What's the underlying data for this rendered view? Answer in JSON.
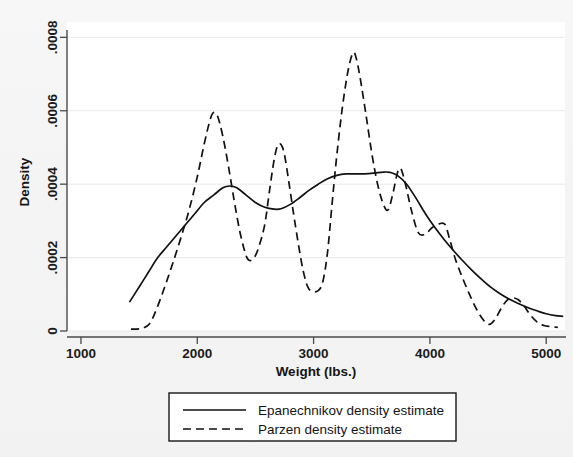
{
  "chart_data": {
    "type": "line",
    "title": "",
    "xlabel": "Weight (lbs.)",
    "ylabel": "Density",
    "xlim": [
      880,
      5170
    ],
    "ylim": [
      0,
      0.00082
    ],
    "xticks": [
      1000,
      2000,
      3000,
      4000,
      5000
    ],
    "xtick_labels": [
      "1000",
      "2000",
      "3000",
      "4000",
      "5000"
    ],
    "yticks": [
      0,
      0.0002,
      0.0004,
      0.0006,
      0.0008
    ],
    "ytick_labels": [
      "0",
      ".0002",
      ".0004",
      ".0006",
      ".0008"
    ],
    "grid": true,
    "legend_position": "below-axes",
    "series": [
      {
        "name": "Epanechnikov density estimate",
        "style": "solid",
        "color": "#111111",
        "points": [
          [
            1420,
            8e-05
          ],
          [
            1500,
            0.00012
          ],
          [
            1580,
            0.00016
          ],
          [
            1660,
            0.0002
          ],
          [
            1740,
            0.00023
          ],
          [
            1820,
            0.00026
          ],
          [
            1900,
            0.00029
          ],
          [
            1980,
            0.00032
          ],
          [
            2060,
            0.00035
          ],
          [
            2140,
            0.00037
          ],
          [
            2220,
            0.00039
          ],
          [
            2280,
            0.000395
          ],
          [
            2340,
            0.00039
          ],
          [
            2420,
            0.00037
          ],
          [
            2500,
            0.00035
          ],
          [
            2580,
            0.000337
          ],
          [
            2660,
            0.000332
          ],
          [
            2720,
            0.000333
          ],
          [
            2800,
            0.000345
          ],
          [
            2880,
            0.000363
          ],
          [
            2960,
            0.000383
          ],
          [
            3040,
            0.0004
          ],
          [
            3120,
            0.000415
          ],
          [
            3200,
            0.000424
          ],
          [
            3280,
            0.000428
          ],
          [
            3360,
            0.000428
          ],
          [
            3440,
            0.000428
          ],
          [
            3520,
            0.00043
          ],
          [
            3600,
            0.000433
          ],
          [
            3660,
            0.000432
          ],
          [
            3720,
            0.000424
          ],
          [
            3800,
            0.0004
          ],
          [
            3880,
            0.000362
          ],
          [
            3960,
            0.00032
          ],
          [
            4040,
            0.000283
          ],
          [
            4120,
            0.00025
          ],
          [
            4200,
            0.00022
          ],
          [
            4280,
            0.000192
          ],
          [
            4360,
            0.000166
          ],
          [
            4440,
            0.000142
          ],
          [
            4520,
            0.00012
          ],
          [
            4600,
            0.000102
          ],
          [
            4680,
            8.7e-05
          ],
          [
            4760,
            7.5e-05
          ],
          [
            4840,
            6.4e-05
          ],
          [
            4920,
            5.5e-05
          ],
          [
            5000,
            4.7e-05
          ],
          [
            5080,
            4.2e-05
          ],
          [
            5140,
            4e-05
          ]
        ]
      },
      {
        "name": "Parzen density estimate",
        "style": "dashed",
        "color": "#111111",
        "points": [
          [
            1430,
            5e-06
          ],
          [
            1520,
            7e-06
          ],
          [
            1590,
            2e-05
          ],
          [
            1650,
            6e-05
          ],
          [
            1720,
            0.00012
          ],
          [
            1790,
            0.000185
          ],
          [
            1860,
            0.000255
          ],
          [
            1930,
            0.00033
          ],
          [
            2000,
            0.00042
          ],
          [
            2060,
            0.00051
          ],
          [
            2110,
            0.000575
          ],
          [
            2140,
            0.000595
          ],
          [
            2175,
            0.000585
          ],
          [
            2220,
            0.00053
          ],
          [
            2270,
            0.000445
          ],
          [
            2320,
            0.00035
          ],
          [
            2370,
            0.000265
          ],
          [
            2420,
            0.000205
          ],
          [
            2450,
            0.000192
          ],
          [
            2490,
            0.0002
          ],
          [
            2530,
            0.00023
          ],
          [
            2580,
            0.00029
          ],
          [
            2620,
            0.00038
          ],
          [
            2660,
            0.000465
          ],
          [
            2690,
            0.000505
          ],
          [
            2720,
            0.000508
          ],
          [
            2750,
            0.00048
          ],
          [
            2790,
            0.0004
          ],
          [
            2830,
            0.000315
          ],
          [
            2870,
            0.000235
          ],
          [
            2910,
            0.000165
          ],
          [
            2950,
            0.00012
          ],
          [
            2990,
            0.000108
          ],
          [
            3040,
            0.00011
          ],
          [
            3080,
            0.000135
          ],
          [
            3120,
            0.000215
          ],
          [
            3160,
            0.00035
          ],
          [
            3200,
            0.00048
          ],
          [
            3250,
            0.000615
          ],
          [
            3300,
            0.000715
          ],
          [
            3340,
            0.000758
          ],
          [
            3365,
            0.000745
          ],
          [
            3400,
            0.00069
          ],
          [
            3450,
            0.00059
          ],
          [
            3500,
            0.000485
          ],
          [
            3550,
            0.0004
          ],
          [
            3600,
            0.000345
          ],
          [
            3640,
            0.00033
          ],
          [
            3680,
            0.000372
          ],
          [
            3720,
            0.00043
          ],
          [
            3750,
            0.000442
          ],
          [
            3790,
            0.0004
          ],
          [
            3840,
            0.00033
          ],
          [
            3900,
            0.000268
          ],
          [
            3960,
            0.000264
          ],
          [
            4020,
            0.000282
          ],
          [
            4080,
            0.000292
          ],
          [
            4130,
            0.00029
          ],
          [
            4170,
            0.00025
          ],
          [
            4220,
            0.000195
          ],
          [
            4280,
            0.000145
          ],
          [
            4340,
            0.0001
          ],
          [
            4400,
            6e-05
          ],
          [
            4460,
            3e-05
          ],
          [
            4510,
            1.8e-05
          ],
          [
            4560,
            3.2e-05
          ],
          [
            4610,
            6e-05
          ],
          [
            4660,
            8.3e-05
          ],
          [
            4710,
            9e-05
          ],
          [
            4760,
            8.5e-05
          ],
          [
            4810,
            6.8e-05
          ],
          [
            4860,
            4.5e-05
          ],
          [
            4920,
            2.5e-05
          ],
          [
            4980,
            1.5e-05
          ],
          [
            5040,
            1.2e-05
          ],
          [
            5100,
            1e-05
          ]
        ]
      }
    ]
  },
  "axes": {
    "y_title": "Density",
    "x_title": "Weight (lbs.)"
  },
  "legend": {
    "entries": [
      {
        "label": "Epanechnikov density estimate",
        "style": "solid"
      },
      {
        "label": "Parzen density estimate",
        "style": "dashed"
      }
    ]
  }
}
